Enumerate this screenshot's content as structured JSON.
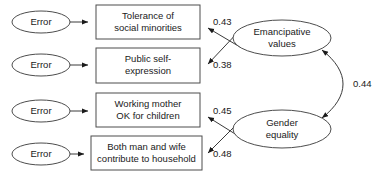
{
  "diagram": {
    "type": "structural-equation-model-path-diagram",
    "background_color": "#ffffff",
    "line_color": "#3a3a3a",
    "box_border_color": "#4d4d4d",
    "text_color": "#1a1a1a",
    "error_terms": [
      {
        "id": "error-1",
        "label": "Error"
      },
      {
        "id": "error-2",
        "label": "Error"
      },
      {
        "id": "error-3",
        "label": "Error"
      },
      {
        "id": "error-4",
        "label": "Error"
      }
    ],
    "indicators": [
      {
        "id": "indicator-tolerance",
        "line1": "Tolerance of",
        "line2": "social minorities"
      },
      {
        "id": "indicator-public-self-expression",
        "line1": "Public self-",
        "line2": "expression"
      },
      {
        "id": "indicator-working-mother",
        "line1": "Working mother",
        "line2": "OK for children"
      },
      {
        "id": "indicator-both-contribute",
        "line1": "Both man and wife",
        "line2": "contribute to household"
      }
    ],
    "latent_factors": [
      {
        "id": "factor-emancipative-values",
        "line1": "Emancipative",
        "line2": "values"
      },
      {
        "id": "factor-gender-equality",
        "line1": "Gender",
        "line2": "equality"
      }
    ],
    "loadings": [
      {
        "id": "loading-tolerance",
        "value": "0.43"
      },
      {
        "id": "loading-public-self-expression",
        "value": "0.38"
      },
      {
        "id": "loading-working-mother",
        "value": "0.45"
      },
      {
        "id": "loading-both-contribute",
        "value": "0.48"
      }
    ],
    "correlation": {
      "id": "correlation-factors",
      "value": "0.44"
    }
  }
}
